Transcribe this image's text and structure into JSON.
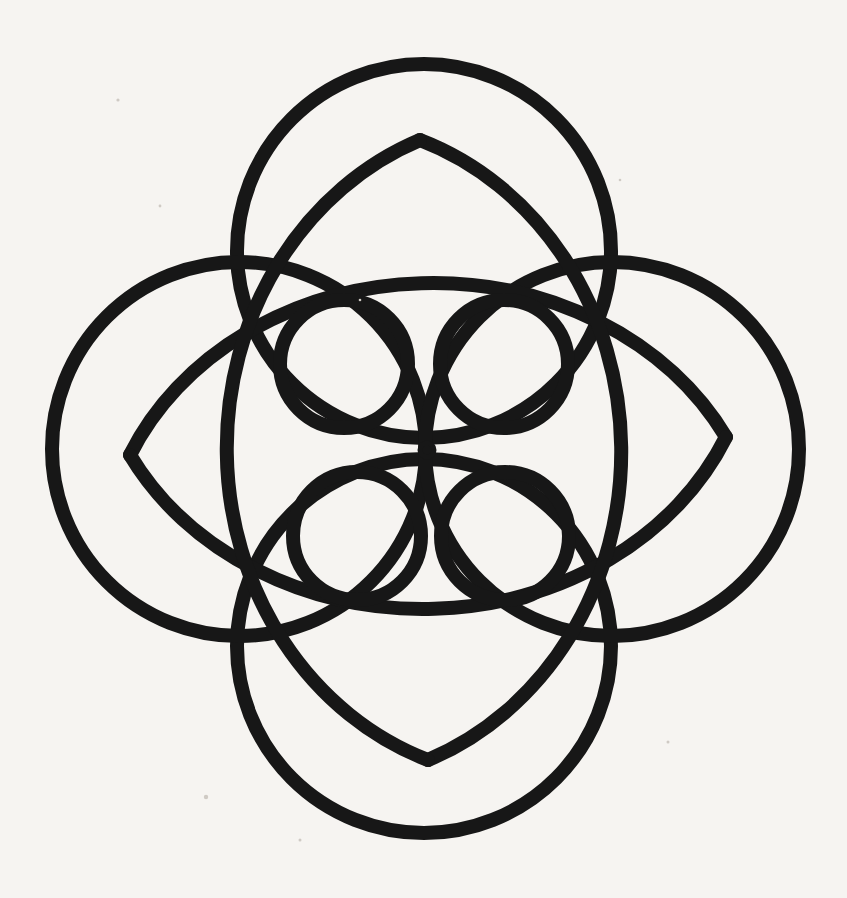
{
  "figure": {
    "canvas": {
      "width": 847,
      "height": 898,
      "background_color": "#f6f4f1",
      "ink_color": "#171717"
    },
    "center_point": {
      "x": 427,
      "y": 450,
      "label": "center-mark"
    },
    "stroke_widths": {
      "large_circle": 14,
      "lens_arc": 14,
      "small_circle": 14,
      "center_ring": 5
    },
    "elements": [
      {
        "name": "large-circle-top",
        "kind": "circle",
        "cx": 424,
        "cy": 251,
        "r": 187,
        "stroke_width": 14
      },
      {
        "name": "large-circle-bottom",
        "kind": "circle",
        "cx": 424,
        "cy": 646,
        "r": 187,
        "stroke_width": 14
      },
      {
        "name": "large-circle-left",
        "kind": "circle",
        "cx": 239,
        "cy": 449,
        "r": 187,
        "stroke_width": 14
      },
      {
        "name": "large-circle-right",
        "kind": "circle",
        "cx": 612,
        "cy": 449,
        "r": 187,
        "stroke_width": 14
      },
      {
        "name": "lens-horizontal-upper-arc",
        "kind": "arc",
        "from": {
          "x": 130,
          "y": 455
        },
        "to": {
          "x": 726,
          "y": 437
        },
        "rx": 330,
        "ry": 285,
        "sweep": 1,
        "stroke_width": 14
      },
      {
        "name": "lens-horizontal-lower-arc",
        "kind": "arc",
        "from": {
          "x": 130,
          "y": 455
        },
        "to": {
          "x": 726,
          "y": 437
        },
        "rx": 330,
        "ry": 285,
        "sweep": 0,
        "stroke_width": 14
      },
      {
        "name": "lens-vertical-left-arc",
        "kind": "arc",
        "from": {
          "x": 420,
          "y": 140
        },
        "to": {
          "x": 428,
          "y": 760
        },
        "rx": 300,
        "ry": 330,
        "sweep": 1,
        "stroke_width": 14
      },
      {
        "name": "lens-vertical-right-arc",
        "kind": "arc",
        "from": {
          "x": 420,
          "y": 140
        },
        "to": {
          "x": 428,
          "y": 760
        },
        "rx": 300,
        "ry": 330,
        "sweep": 0,
        "stroke_width": 14
      },
      {
        "name": "small-circle-top-left",
        "kind": "circle",
        "cx": 344,
        "cy": 364,
        "r": 64,
        "stroke_width": 14
      },
      {
        "name": "small-circle-top-right",
        "kind": "circle",
        "cx": 504,
        "cy": 364,
        "r": 64,
        "stroke_width": 14
      },
      {
        "name": "small-circle-bottom-left",
        "kind": "circle",
        "cx": 357,
        "cy": 536,
        "r": 64,
        "stroke_width": 14
      },
      {
        "name": "small-circle-bottom-right",
        "kind": "circle",
        "cx": 505,
        "cy": 536,
        "r": 64,
        "stroke_width": 14
      },
      {
        "name": "center-ring",
        "kind": "circle",
        "cx": 427,
        "cy": 450,
        "r": 7,
        "stroke_width": 5
      }
    ],
    "crossing_nodes": [
      {
        "name": "node-top",
        "x": 420,
        "y": 140
      },
      {
        "name": "node-bottom",
        "x": 428,
        "y": 760
      },
      {
        "name": "node-left",
        "x": 130,
        "y": 455
      },
      {
        "name": "node-right",
        "x": 726,
        "y": 437
      }
    ],
    "specks": [
      {
        "x": 206,
        "y": 797,
        "r": 2.2
      },
      {
        "x": 118,
        "y": 100,
        "r": 1.6
      },
      {
        "x": 668,
        "y": 742,
        "r": 1.5
      },
      {
        "x": 160,
        "y": 206,
        "r": 1.4
      },
      {
        "x": 360,
        "y": 300,
        "r": 1.3
      },
      {
        "x": 620,
        "y": 180,
        "r": 1.3
      },
      {
        "x": 300,
        "y": 840,
        "r": 1.5
      }
    ]
  }
}
